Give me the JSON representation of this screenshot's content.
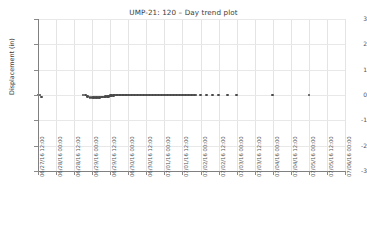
{
  "chart_data": {
    "type": "scatter",
    "title": "UMP-21: 120 – Day trend plot",
    "xlabel": "",
    "ylabel": "Displacement (in)",
    "ylim": [
      -3,
      3
    ],
    "yticks": [
      "3",
      "2",
      "1",
      "0",
      "-1",
      "-2",
      "-3"
    ],
    "ytick_values": [
      3,
      2,
      1,
      0,
      -1,
      -2,
      -3
    ],
    "grid": true,
    "legend": "none",
    "marker_color": "#4a4a4a",
    "grid_color": "#e4e4e4",
    "axis_color": "#808080",
    "xticks": [
      "06/27/16 12:00",
      "06/28/16 00:00",
      "06/28/16 12:00",
      "06/29/16 00:00",
      "06/29/16 12:00",
      "06/30/16 00:00",
      "06/30/16 12:00",
      "07/01/16 00:00",
      "07/01/16 12:00",
      "07/02/16 00:00",
      "07/02/16 12:00",
      "07/03/16 00:00",
      "07/03/16 12:00",
      "07/04/16 00:00",
      "07/04/16 12:00",
      "07/05/16 00:00",
      "07/05/16 12:00",
      "07/06/16 00:00"
    ],
    "xlim": [
      "06/27/16 12:00",
      "07/06/16 00:00"
    ],
    "x_hours_from_start": [
      0,
      1.2,
      2.4,
      30,
      31.5,
      33,
      34.5,
      36,
      37,
      38,
      39,
      40,
      41,
      42,
      43,
      44,
      45,
      46,
      47,
      48,
      49,
      50,
      51,
      52,
      53,
      54,
      55,
      56,
      57,
      58,
      59,
      60,
      61,
      62,
      63,
      64,
      65,
      66,
      67,
      68,
      69,
      70,
      71,
      72,
      73,
      74,
      75,
      76,
      77,
      78,
      79,
      80,
      81,
      82,
      83,
      84,
      85,
      86,
      87,
      88,
      89,
      90,
      91,
      92,
      93,
      94,
      95,
      96,
      97,
      98,
      99,
      100,
      101,
      102,
      103,
      104,
      105,
      108,
      112,
      116,
      120,
      126,
      132,
      156,
      180,
      228
    ],
    "y_values": [
      0,
      0,
      -0.08,
      0,
      0,
      -0.05,
      -0.1,
      -0.1,
      -0.1,
      -0.1,
      -0.1,
      -0.1,
      -0.1,
      -0.08,
      -0.08,
      -0.08,
      -0.05,
      -0.05,
      -0.05,
      -0.03,
      -0.03,
      -0.03,
      0,
      0,
      0,
      0,
      0,
      0,
      0,
      0,
      0,
      0,
      0,
      0,
      0,
      0,
      0,
      0,
      0,
      0,
      0,
      0,
      0,
      0,
      0,
      0,
      0,
      0,
      0,
      0,
      0,
      0,
      0,
      0,
      0,
      0,
      0,
      0,
      0,
      0,
      0,
      0,
      0,
      0,
      0,
      0,
      0,
      0,
      0,
      0,
      0,
      0,
      0,
      0,
      0,
      0,
      0,
      0,
      0,
      0,
      0,
      0,
      0,
      0,
      0,
      0
    ]
  }
}
